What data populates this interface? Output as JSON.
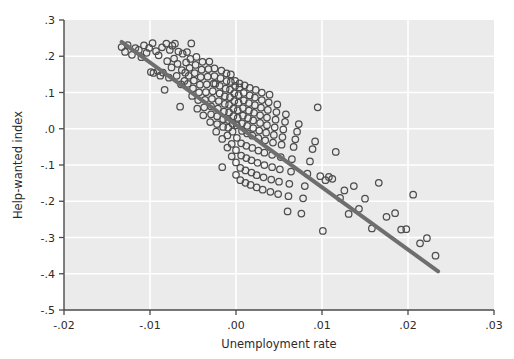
{
  "chart_data": {
    "type": "scatter",
    "title": "",
    "xlabel": "Unemployment rate",
    "ylabel": "Help-wanted index",
    "xlim": [
      -0.02,
      0.03
    ],
    "ylim": [
      -0.5,
      0.3
    ],
    "xticks": [
      -0.02,
      -0.01,
      0.0,
      0.01,
      0.02,
      0.03
    ],
    "xticklabels": [
      "-.02",
      "-.01",
      ".00",
      ".01",
      ".02",
      ".03"
    ],
    "yticks": [
      0.3,
      0.2,
      0.1,
      0.0,
      -0.1,
      -0.2,
      -0.3,
      -0.4,
      -0.5
    ],
    "yticklabels": [
      ".3",
      ".2",
      ".1",
      ".0",
      "-.1",
      "-.2",
      "-.3",
      "-.4",
      "-.5"
    ],
    "grid": true,
    "grid_color": "#ffffff",
    "plot_background": "#ebebeb",
    "marker": "open-circle",
    "marker_color": "#4d4d4d",
    "marker_size": 6.5,
    "legend": null,
    "fit_line": {
      "name": "linear fit",
      "color": "#6e6e6e",
      "width": 4,
      "x": [
        -0.0133,
        0.0235
      ],
      "y": [
        0.2395,
        -0.3935
      ],
      "slope": -17.2,
      "intercept": 0.0108
    },
    "series": [
      {
        "name": "observations",
        "n": 232,
        "points": [
          [
            -0.0133,
            0.2255
          ],
          [
            -0.0129,
            0.212
          ],
          [
            -0.0126,
            0.231
          ],
          [
            -0.0121,
            0.204
          ],
          [
            -0.0117,
            0.2225
          ],
          [
            -0.0113,
            0.2175
          ],
          [
            -0.011,
            0.1975
          ],
          [
            -0.0107,
            0.23
          ],
          [
            -0.0104,
            0.2095
          ],
          [
            -0.0101,
            0.223
          ],
          [
            -0.0099,
            0.1565
          ],
          [
            -0.0097,
            0.236
          ],
          [
            -0.0096,
            0.154
          ],
          [
            -0.0093,
            0.214
          ],
          [
            -0.0091,
            0.159
          ],
          [
            -0.009,
            0.2025
          ],
          [
            -0.0088,
            0.1465
          ],
          [
            -0.0086,
            0.2245
          ],
          [
            -0.0085,
            0.155
          ],
          [
            -0.0083,
            0.1075
          ],
          [
            -0.0081,
            0.235
          ],
          [
            -0.008,
            0.1865
          ],
          [
            -0.0078,
            0.141
          ],
          [
            -0.0077,
            0.2175
          ],
          [
            -0.0075,
            0.169
          ],
          [
            -0.0074,
            0.229
          ],
          [
            -0.0072,
            0.1935
          ],
          [
            -0.0071,
            0.2345
          ],
          [
            -0.0069,
            0.146
          ],
          [
            -0.0068,
            0.179
          ],
          [
            -0.0067,
            0.213
          ],
          [
            -0.0065,
            0.061
          ],
          [
            -0.0064,
            0.1225
          ],
          [
            -0.0063,
            0.162
          ],
          [
            -0.0062,
            0.207
          ],
          [
            -0.006,
            0.132
          ],
          [
            -0.0059,
            0.1545
          ],
          [
            -0.0058,
            0.183
          ],
          [
            -0.0057,
            0.2115
          ],
          [
            -0.0056,
            0.124
          ],
          [
            -0.0055,
            0.146
          ],
          [
            -0.0054,
            0.168
          ],
          [
            -0.0053,
            0.1925
          ],
          [
            -0.0052,
            0.2355
          ],
          [
            -0.0051,
            0.0905
          ],
          [
            -0.005,
            0.1115
          ],
          [
            -0.0049,
            0.133
          ],
          [
            -0.0048,
            0.1535
          ],
          [
            -0.0047,
            0.176
          ],
          [
            -0.0046,
            0.198
          ],
          [
            -0.0045,
            0.0555
          ],
          [
            -0.0044,
            0.079
          ],
          [
            -0.0043,
            0.1005
          ],
          [
            -0.0042,
            0.1215
          ],
          [
            -0.0041,
            0.1425
          ],
          [
            -0.004,
            0.163
          ],
          [
            -0.0039,
            0.1845
          ],
          [
            -0.0038,
            0.037
          ],
          [
            -0.0037,
            0.059
          ],
          [
            -0.0036,
            0.08
          ],
          [
            -0.0035,
            0.101
          ],
          [
            -0.0034,
            0.1225
          ],
          [
            -0.0033,
            0.1435
          ],
          [
            -0.0032,
            0.1645
          ],
          [
            -0.0031,
            0.1855
          ],
          [
            -0.003,
            0.0185
          ],
          [
            -0.0029,
            0.04
          ],
          [
            -0.0029,
            0.0615
          ],
          [
            -0.0028,
            0.0825
          ],
          [
            -0.0027,
            0.1035
          ],
          [
            -0.0026,
            0.1245
          ],
          [
            -0.0025,
            0.1455
          ],
          [
            -0.0025,
            0.1665
          ],
          [
            -0.0024,
            0.124
          ],
          [
            -0.0023,
            -0.008
          ],
          [
            -0.0022,
            0.013
          ],
          [
            -0.0022,
            0.0345
          ],
          [
            -0.0021,
            0.0555
          ],
          [
            -0.002,
            0.0765
          ],
          [
            -0.0019,
            0.0975
          ],
          [
            -0.0019,
            0.1185
          ],
          [
            -0.0018,
            0.1395
          ],
          [
            -0.0017,
            0.1605
          ],
          [
            -0.0016,
            -0.106
          ],
          [
            -0.0016,
            -0.028
          ],
          [
            -0.0015,
            0.005
          ],
          [
            -0.0015,
            0.0265
          ],
          [
            -0.0014,
            0.0475
          ],
          [
            -0.0013,
            0.0685
          ],
          [
            -0.0013,
            0.0895
          ],
          [
            -0.0012,
            0.1105
          ],
          [
            -0.0011,
            0.1315
          ],
          [
            -0.0011,
            0.1525
          ],
          [
            -0.001,
            -0.052
          ],
          [
            -0.001,
            -0.0185
          ],
          [
            -0.0009,
            0.003
          ],
          [
            -0.0009,
            0.024
          ],
          [
            -0.0008,
            0.045
          ],
          [
            -0.0008,
            0.066
          ],
          [
            -0.0007,
            0.087
          ],
          [
            -0.0007,
            0.108
          ],
          [
            -0.0006,
            0.129
          ],
          [
            -0.0006,
            0.15
          ],
          [
            -0.0005,
            -0.076
          ],
          [
            -0.0005,
            -0.042
          ],
          [
            -0.0004,
            -0.008
          ],
          [
            -0.0004,
            0.0135
          ],
          [
            -0.0003,
            0.0345
          ],
          [
            -0.0003,
            0.0555
          ],
          [
            -0.0002,
            0.0765
          ],
          [
            -0.0002,
            0.0975
          ],
          [
            -0.0001,
            0.1185
          ],
          [
            -0.0001,
            0.132
          ],
          [
            0.0,
            -0.127
          ],
          [
            0.0,
            -0.093
          ],
          [
            0.0,
            -0.059
          ],
          [
            0.0001,
            -0.025
          ],
          [
            0.0001,
            0.009
          ],
          [
            0.0002,
            0.03
          ],
          [
            0.0002,
            0.051
          ],
          [
            0.0003,
            0.072
          ],
          [
            0.0003,
            0.093
          ],
          [
            0.0004,
            0.114
          ],
          [
            0.0004,
            0.125
          ],
          [
            0.0005,
            -0.142
          ],
          [
            0.0005,
            -0.108
          ],
          [
            0.0006,
            -0.074
          ],
          [
            0.0006,
            -0.04
          ],
          [
            0.0007,
            -0.006
          ],
          [
            0.0007,
            0.015
          ],
          [
            0.0008,
            0.036
          ],
          [
            0.0008,
            0.057
          ],
          [
            0.0009,
            0.078
          ],
          [
            0.0009,
            0.099
          ],
          [
            0.001,
            0.12
          ],
          [
            0.0011,
            -0.149
          ],
          [
            0.0011,
            -0.115
          ],
          [
            0.0012,
            -0.081
          ],
          [
            0.0012,
            -0.047
          ],
          [
            0.0013,
            -0.013
          ],
          [
            0.0013,
            0.008
          ],
          [
            0.0014,
            0.029
          ],
          [
            0.0015,
            0.05
          ],
          [
            0.0015,
            0.071
          ],
          [
            0.0016,
            0.092
          ],
          [
            0.0016,
            0.113
          ],
          [
            0.0017,
            -0.155
          ],
          [
            0.0018,
            -0.121
          ],
          [
            0.0018,
            -0.087
          ],
          [
            0.0019,
            -0.053
          ],
          [
            0.0019,
            -0.019
          ],
          [
            0.002,
            0.002
          ],
          [
            0.002,
            0.023
          ],
          [
            0.0021,
            0.044
          ],
          [
            0.0022,
            0.065
          ],
          [
            0.0022,
            0.086
          ],
          [
            0.0023,
            0.107
          ],
          [
            0.0024,
            -0.162
          ],
          [
            0.0024,
            -0.128
          ],
          [
            0.0025,
            -0.094
          ],
          [
            0.0026,
            -0.06
          ],
          [
            0.0026,
            -0.026
          ],
          [
            0.0027,
            -0.005
          ],
          [
            0.0028,
            0.016
          ],
          [
            0.0028,
            0.037
          ],
          [
            0.0029,
            0.058
          ],
          [
            0.003,
            0.079
          ],
          [
            0.003,
            0.1
          ],
          [
            0.0031,
            -0.168
          ],
          [
            0.0032,
            -0.134
          ],
          [
            0.0033,
            -0.1
          ],
          [
            0.0033,
            -0.066
          ],
          [
            0.0034,
            -0.032
          ],
          [
            0.0035,
            -0.011
          ],
          [
            0.0036,
            0.01
          ],
          [
            0.0036,
            0.031
          ],
          [
            0.0037,
            0.052
          ],
          [
            0.0038,
            0.073
          ],
          [
            0.0039,
            0.094
          ],
          [
            0.004,
            -0.174
          ],
          [
            0.0041,
            -0.14
          ],
          [
            0.0042,
            -0.106
          ],
          [
            0.0042,
            -0.072
          ],
          [
            0.0043,
            -0.038
          ],
          [
            0.0044,
            -0.017
          ],
          [
            0.0045,
            0.004
          ],
          [
            0.0046,
            0.025
          ],
          [
            0.0047,
            0.046
          ],
          [
            0.0048,
            0.067
          ],
          [
            0.0049,
            -0.18
          ],
          [
            0.005,
            -0.146
          ],
          [
            0.0051,
            -0.112
          ],
          [
            0.0052,
            -0.078
          ],
          [
            0.0053,
            -0.044
          ],
          [
            0.0054,
            -0.023
          ],
          [
            0.0055,
            -0.002
          ],
          [
            0.0057,
            0.019
          ],
          [
            0.0058,
            0.04
          ],
          [
            0.006,
            -0.228
          ],
          [
            0.0061,
            -0.186
          ],
          [
            0.0062,
            -0.152
          ],
          [
            0.0064,
            -0.118
          ],
          [
            0.0065,
            -0.084
          ],
          [
            0.0067,
            -0.05
          ],
          [
            0.0069,
            -0.029
          ],
          [
            0.0071,
            -0.008
          ],
          [
            0.0073,
            0.013
          ],
          [
            0.0076,
            -0.234
          ],
          [
            0.0078,
            -0.192
          ],
          [
            0.008,
            -0.158
          ],
          [
            0.0083,
            -0.124
          ],
          [
            0.0086,
            -0.09
          ],
          [
            0.0089,
            -0.056
          ],
          [
            0.0092,
            -0.035
          ],
          [
            0.0095,
            0.059
          ],
          [
            0.0098,
            -0.131
          ],
          [
            0.0101,
            -0.282
          ],
          [
            0.0104,
            -0.142
          ],
          [
            0.0108,
            -0.133
          ],
          [
            0.0112,
            -0.138
          ],
          [
            0.0116,
            -0.064
          ],
          [
            0.0121,
            -0.191
          ],
          [
            0.0126,
            -0.17
          ],
          [
            0.0131,
            -0.235
          ],
          [
            0.0137,
            -0.158
          ],
          [
            0.0143,
            -0.221
          ],
          [
            0.015,
            -0.193
          ],
          [
            0.0158,
            -0.275
          ],
          [
            0.0166,
            -0.149
          ],
          [
            0.0175,
            -0.243
          ],
          [
            0.0185,
            -0.233
          ],
          [
            0.0192,
            -0.278
          ],
          [
            0.0198,
            -0.277
          ],
          [
            0.0206,
            -0.182
          ],
          [
            0.0214,
            -0.316
          ],
          [
            0.0222,
            -0.302
          ],
          [
            0.0232,
            -0.35
          ]
        ]
      }
    ]
  },
  "axis_geometry": {
    "plot_left": 64,
    "plot_right": 494,
    "plot_top": 20,
    "plot_bottom": 310
  }
}
